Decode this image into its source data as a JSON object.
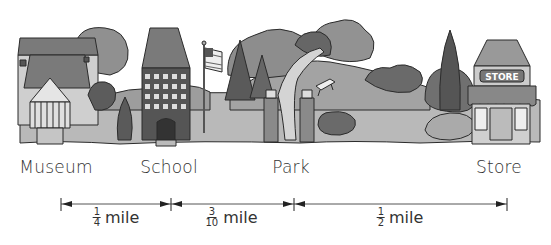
{
  "places": [
    {
      "name": "Museum",
      "x": 56
    },
    {
      "name": "School",
      "x": 169
    },
    {
      "name": "Park",
      "x": 291
    },
    {
      "name": "Store",
      "x": 499
    }
  ],
  "store_sign": "STORE",
  "distance_markers_x": [
    61,
    171,
    294,
    507
  ],
  "segments": [
    {
      "from": "Museum",
      "to": "School",
      "numerator": "1",
      "denominator": "4",
      "unit": "mile",
      "label_x": 116
    },
    {
      "from": "School",
      "to": "Park",
      "numerator": "3",
      "denominator": "10",
      "unit": "mile",
      "label_x": 231
    },
    {
      "from": "Park",
      "to": "Store",
      "numerator": "1",
      "denominator": "2",
      "unit": "mile",
      "label_x": 400
    }
  ],
  "colors": {
    "ground": "#b9b9b9",
    "hill": "#9d9d9d",
    "tree_dark": "#5e5e5e",
    "tree_mid": "#868686",
    "roof": "#7a7a7a",
    "wall": "#cfcfcf",
    "outline": "#2b2b2b"
  }
}
